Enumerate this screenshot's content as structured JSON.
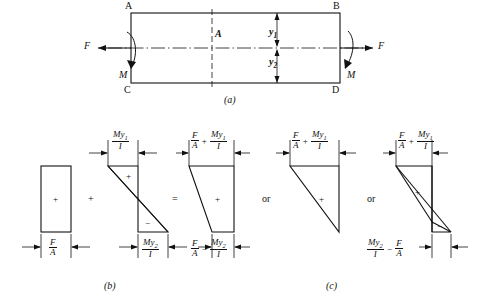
{
  "figure": {
    "title_a": "(a)",
    "title_b": "(b)",
    "title_c": "(c)",
    "stroke_color": "#111111",
    "background": "#ffffff"
  },
  "beam": {
    "corner_labels": {
      "top_left": "A",
      "top_right": "B",
      "bottom_left": "C",
      "bottom_right": "D"
    },
    "section_label": "A",
    "force_left": "F",
    "force_right": "F",
    "moment_left": "M",
    "moment_right": "M",
    "distance_upper": "y",
    "distance_upper_sub": "1",
    "distance_lower": "y",
    "distance_lower_sub": "2"
  },
  "stress_blocks": [
    {
      "name": "axial-stress-block",
      "shape": "rectangle",
      "sign": "+",
      "top_label": null,
      "bottom_label": {
        "num": "F",
        "den": "A"
      }
    },
    {
      "name": "bending-stress-block",
      "shape": "bowtie",
      "sign_top": "+",
      "sign_bottom": "−",
      "top_label": {
        "num": "My",
        "num_sub": "1",
        "den": "I"
      },
      "bottom_label": {
        "num": "My",
        "num_sub": "2",
        "den": "I"
      }
    },
    {
      "name": "combined-stress-trapezoid",
      "shape": "trapezoid",
      "sign": "+",
      "top_label_terms": [
        {
          "num": "F",
          "den": "A"
        },
        {
          "op": "+"
        },
        {
          "num": "My",
          "num_sub": "1",
          "den": "I"
        }
      ],
      "bottom_label_terms": [
        {
          "num": "F",
          "den": "A"
        },
        {
          "op": "−"
        },
        {
          "num": "My",
          "num_sub": "2",
          "den": "I"
        }
      ]
    },
    {
      "name": "combined-stress-triangle",
      "shape": "triangle",
      "sign": "+",
      "top_label_terms": [
        {
          "num": "F",
          "den": "A"
        },
        {
          "op": "+"
        },
        {
          "num": "My",
          "num_sub": "1",
          "den": "I"
        }
      ],
      "bottom_label_terms": []
    },
    {
      "name": "combined-stress-reversal",
      "shape": "triangle-with-reversal",
      "sign_top": "+",
      "sign_bottom": "−",
      "top_label_terms": [
        {
          "num": "F",
          "den": "A"
        },
        {
          "op": "+"
        },
        {
          "num": "My",
          "num_sub": "1",
          "den": "I"
        }
      ],
      "bottom_label_terms": [
        {
          "num": "My",
          "num_sub": "2",
          "den": "I"
        },
        {
          "op": "−"
        },
        {
          "num": "F",
          "den": "A"
        }
      ]
    }
  ],
  "operators": {
    "plus_1": "+",
    "equals": "=",
    "or_1": "or",
    "or_2": "or"
  }
}
